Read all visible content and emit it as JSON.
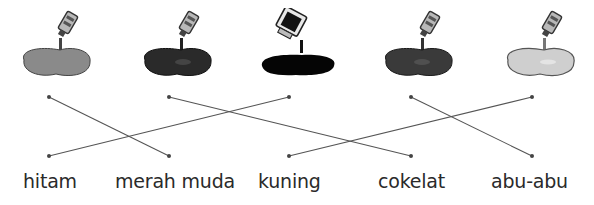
{
  "exercise": {
    "paints": [
      {
        "id": "paint-1",
        "color": "#8a8a8a",
        "tube": "small"
      },
      {
        "id": "paint-2",
        "color": "#2a2a2a",
        "tube": "small"
      },
      {
        "id": "paint-3",
        "color": "#050505",
        "tube": "bottle"
      },
      {
        "id": "paint-4",
        "color": "#3a3a3a",
        "tube": "small"
      },
      {
        "id": "paint-5",
        "color": "#cfcfcf",
        "tube": "small"
      }
    ],
    "labels": [
      "hitam",
      "merah muda",
      "kuning",
      "cokelat",
      "abu-abu"
    ],
    "top_dots_x": [
      49,
      169,
      289,
      411,
      532
    ],
    "bottom_dots_x": [
      49,
      169,
      289,
      411,
      532
    ],
    "connections": [
      {
        "from_top": 0,
        "to_bottom": 1
      },
      {
        "from_top": 1,
        "to_bottom": 3
      },
      {
        "from_top": 2,
        "to_bottom": 0
      },
      {
        "from_top": 3,
        "to_bottom": 4
      },
      {
        "from_top": 4,
        "to_bottom": 2
      }
    ],
    "line_color": "#555555"
  }
}
